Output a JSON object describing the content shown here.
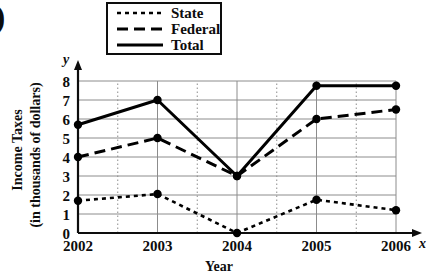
{
  "figure": {
    "corner_mark": ")"
  },
  "chart_data": {
    "type": "line",
    "title": "",
    "xlabel": "Year",
    "ylabel": "Income Taxes\n(in thousands of dollars)",
    "ylabel_line1": "Income Taxes",
    "ylabel_line2": "(in thousands of dollars)",
    "x_axis_symbol": "x",
    "y_axis_symbol": "y",
    "categories": [
      "2002",
      "2003",
      "2004",
      "2005",
      "2006"
    ],
    "x_tick_labels": [
      "2002",
      "2003",
      "2004",
      "2005",
      "2006"
    ],
    "y_tick_labels": [
      "0",
      "1",
      "2",
      "3",
      "4",
      "5",
      "6",
      "7",
      "8"
    ],
    "y_ticks": [
      0,
      1,
      2,
      3,
      4,
      5,
      6,
      7,
      8
    ],
    "ylim": [
      0,
      8
    ],
    "grid": true,
    "grid_color": "#8c8c8c",
    "legend_position": "top",
    "series": [
      {
        "name": "State",
        "dash": "dotted",
        "color": "#000000",
        "values": [
          1.7,
          2.05,
          0,
          1.75,
          1.2
        ]
      },
      {
        "name": "Federal",
        "dash": "dashed",
        "color": "#000000",
        "values": [
          4.0,
          5.0,
          3.0,
          6.0,
          6.5
        ]
      },
      {
        "name": "Total",
        "dash": "solid",
        "color": "#000000",
        "values": [
          5.7,
          7.0,
          3.0,
          7.75,
          7.75
        ]
      }
    ]
  },
  "legend": {
    "items": [
      {
        "label": "State"
      },
      {
        "label": "Federal"
      },
      {
        "label": "Total"
      }
    ]
  }
}
